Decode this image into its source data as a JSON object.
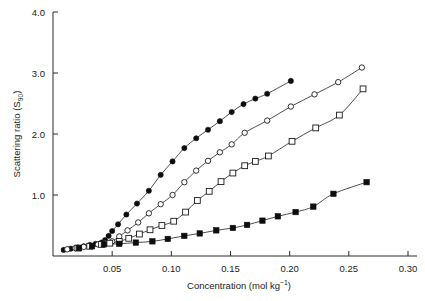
{
  "chart_data": {
    "type": "scatter",
    "title": "",
    "xlabel": "Concentration (mol kg⁻¹)",
    "xlabel_main": "Concentration (mol kg",
    "xlabel_sup": "−1",
    "xlabel_tail": ")",
    "ylabel": "Scattering ratio (S₉₀)",
    "ylabel_main": "Scattering ratio (S",
    "ylabel_sub": "90",
    "ylabel_tail": ")",
    "xlim": [
      0.0,
      0.305
    ],
    "ylim": [
      0.0,
      4.0
    ],
    "grid": false,
    "legend": "none",
    "xticks": [
      0.05,
      0.1,
      0.15,
      0.2,
      0.25,
      0.3
    ],
    "xtick_labels": [
      "0.05",
      "0.10",
      "0.15",
      "0.20",
      "0.25",
      "0.30"
    ],
    "yticks": [
      1.0,
      2.0,
      3.0,
      4.0
    ],
    "ytick_labels": [
      "1.0",
      "2.0",
      "3.0",
      "4.0"
    ],
    "series": [
      {
        "name": "filled-circle-series",
        "marker": "filled-circle",
        "color": "#0d0d0d",
        "x": [
          0.009,
          0.015,
          0.021,
          0.026,
          0.031,
          0.036,
          0.041,
          0.044,
          0.047,
          0.05,
          0.055,
          0.062,
          0.071,
          0.081,
          0.091,
          0.101,
          0.111,
          0.121,
          0.131,
          0.141,
          0.151,
          0.161,
          0.171,
          0.181,
          0.201
        ],
        "y": [
          0.1,
          0.12,
          0.14,
          0.16,
          0.18,
          0.2,
          0.22,
          0.26,
          0.33,
          0.41,
          0.52,
          0.68,
          0.86,
          1.07,
          1.33,
          1.55,
          1.77,
          1.93,
          2.07,
          2.21,
          2.36,
          2.49,
          2.58,
          2.66,
          2.87
        ]
      },
      {
        "name": "open-circle-series",
        "marker": "open-circle",
        "color": "#1a1a1a",
        "x": [
          0.012,
          0.019,
          0.026,
          0.032,
          0.038,
          0.044,
          0.05,
          0.056,
          0.063,
          0.072,
          0.081,
          0.091,
          0.101,
          0.111,
          0.121,
          0.131,
          0.141,
          0.151,
          0.162,
          0.181,
          0.201,
          0.221,
          0.241,
          0.261
        ],
        "y": [
          0.11,
          0.13,
          0.15,
          0.17,
          0.19,
          0.21,
          0.24,
          0.32,
          0.42,
          0.55,
          0.7,
          0.85,
          1.0,
          1.21,
          1.4,
          1.56,
          1.7,
          1.83,
          2.02,
          2.22,
          2.45,
          2.65,
          2.85,
          3.09
        ]
      },
      {
        "name": "open-square-series",
        "marker": "open-square",
        "color": "#1a1a1a",
        "x": [
          0.021,
          0.031,
          0.041,
          0.048,
          0.056,
          0.064,
          0.073,
          0.082,
          0.092,
          0.102,
          0.112,
          0.122,
          0.132,
          0.142,
          0.152,
          0.162,
          0.171,
          0.182,
          0.202,
          0.222,
          0.242,
          0.262
        ],
        "y": [
          0.13,
          0.16,
          0.19,
          0.21,
          0.24,
          0.29,
          0.36,
          0.43,
          0.5,
          0.57,
          0.72,
          0.91,
          1.06,
          1.22,
          1.36,
          1.48,
          1.55,
          1.64,
          1.88,
          2.1,
          2.31,
          2.74
        ]
      },
      {
        "name": "filled-square-series",
        "marker": "filled-square",
        "color": "#0d0d0d",
        "x": [
          0.022,
          0.033,
          0.043,
          0.056,
          0.07,
          0.084,
          0.097,
          0.111,
          0.124,
          0.138,
          0.152,
          0.164,
          0.177,
          0.19,
          0.205,
          0.22,
          0.237,
          0.265
        ],
        "y": [
          0.13,
          0.16,
          0.19,
          0.2,
          0.22,
          0.24,
          0.28,
          0.33,
          0.37,
          0.42,
          0.46,
          0.51,
          0.58,
          0.65,
          0.72,
          0.81,
          1.02,
          1.21
        ]
      }
    ],
    "fit_lines": [
      {
        "name": "filled-circle-fit",
        "for": "filled-circle-series"
      },
      {
        "name": "open-circle-fit",
        "for": "open-circle-series"
      },
      {
        "name": "open-square-fit",
        "for": "open-square-series"
      },
      {
        "name": "filled-square-fit",
        "for": "filled-square-series"
      }
    ]
  }
}
